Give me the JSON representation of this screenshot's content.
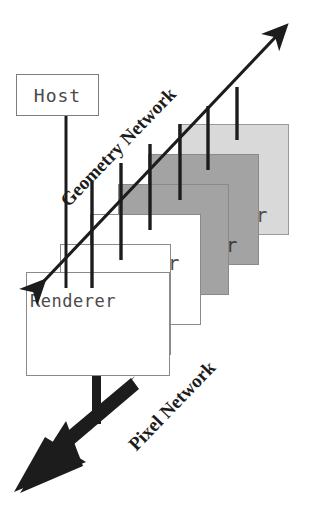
{
  "diagram": {
    "background_color": "#ffffff",
    "host": {
      "label": "Host",
      "fill": "#ffffff",
      "stroke": "#7d7d7d"
    },
    "renderer_front": {
      "label": "Renderer"
    },
    "stack": {
      "tail_label": "r",
      "count": 6,
      "description": "Cascading stack of Renderer units",
      "boxes": [
        {
          "index": 0,
          "fill": "#d9d9d9",
          "stroke": "#9a9a9a",
          "layer": "back",
          "tail": "r"
        },
        {
          "index": 1,
          "fill": "#a3a3a3",
          "stroke": "#8a8a8a",
          "layer": "back",
          "tail": "r"
        },
        {
          "index": 2,
          "fill": "#a3a3a3",
          "stroke": "#8a8a8a",
          "layer": "back",
          "tail": ""
        },
        {
          "index": 3,
          "fill": "#ffffff",
          "stroke": "#8a8a8a",
          "layer": "front",
          "tail": "r"
        },
        {
          "index": 4,
          "fill": "#ffffff",
          "stroke": "#8a8a8a",
          "layer": "front",
          "tail": "r"
        },
        {
          "index": 5,
          "fill": "#ffffff",
          "stroke": "#8a8a8a",
          "layer": "front",
          "tail": ""
        }
      ]
    },
    "geometry_network": {
      "label": "Geometry Network",
      "arrow_style": "double-headed",
      "color": "#1c1c1c"
    },
    "pixel_network": {
      "label": "Pixel Network",
      "arrow_style": "single-headed-thick",
      "color": "#1c1c1c"
    },
    "colors": {
      "ink": "#1c1c1c",
      "box_text": "#4a4a4a",
      "light_grey": "#d9d9d9",
      "mid_grey": "#a3a3a3",
      "white": "#ffffff"
    }
  }
}
